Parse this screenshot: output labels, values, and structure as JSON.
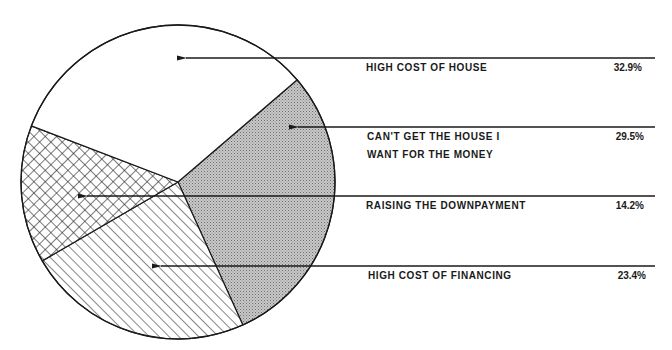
{
  "chart_data": {
    "type": "pie",
    "title": "",
    "start_angle_deg": -40.6,
    "direction": "clockwise",
    "slices": [
      {
        "label": "CAN'T GET THE HOUSE I\nWANT FOR THE MONEY",
        "value": 29.5,
        "display": "29.5%",
        "pattern": "dotted-gray"
      },
      {
        "label": "HIGH COST OF FINANCING",
        "value": 23.4,
        "display": "23.4%",
        "pattern": "diagonal-hatch"
      },
      {
        "label": "RAISING THE DOWNPAYMENT",
        "value": 14.2,
        "display": "14.2%",
        "pattern": "crosshatch"
      },
      {
        "label": "HIGH COST OF HOUSE",
        "value": 32.9,
        "display": "32.9%",
        "pattern": "white"
      }
    ],
    "legend_position": "right",
    "legend_style": "leader-arrows"
  },
  "legend": {
    "items": [
      {
        "label": "HIGH COST OF HOUSE",
        "pct": "32.9%"
      },
      {
        "label": "CAN'T GET THE HOUSE I\nWANT FOR THE MONEY",
        "pct": "29.5%"
      },
      {
        "label": "RAISING THE DOWNPAYMENT",
        "pct": "14.2%"
      },
      {
        "label": "HIGH COST OF FINANCING",
        "pct": "23.4%"
      }
    ]
  },
  "colors": {
    "outline": "#1a1a1a",
    "gray_fill": "#bcbcbc",
    "background": "#ffffff"
  }
}
